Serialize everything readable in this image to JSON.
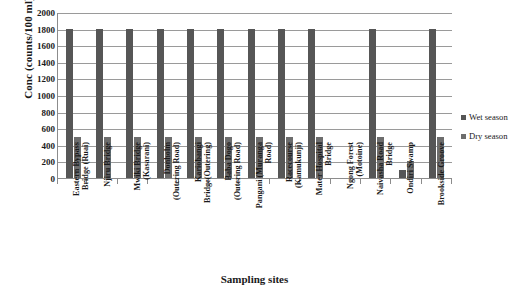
{
  "chart_data": {
    "type": "bar",
    "title": "",
    "xlabel": "Sampling sites",
    "ylabel": "Conc (counts/100 ml)",
    "ylim": [
      0,
      2000
    ],
    "ytick_step": 200,
    "yticks": [
      2000,
      1800,
      1600,
      1400,
      1200,
      1000,
      800,
      600,
      400,
      200,
      0
    ],
    "grid": true,
    "legend_position": "right",
    "categories": [
      "Eastern Bypass Bridge (Ruai)",
      "Njiru Bridge",
      "Mwiki Bridge (Kasarani)",
      "Donholm (Outering Road)",
      "Kariobangi Bridge(Outering)",
      "Baba Dogo (Outering Road)",
      "Pangani (Muranga Road)",
      "Racecourse (Kamukunji)",
      "Mater Hospital Bridge",
      "Ngong Forest (Motoine)",
      "Naivasha Road Bridge",
      "Ondiri Swamp",
      "Brookside Groove"
    ],
    "category_lines": [
      [
        "Eastern Bypass",
        "Bridge (Ruai)"
      ],
      [
        "Njiru Bridge"
      ],
      [
        "Mwiki Bridge",
        "(Kasarani)"
      ],
      [
        "Donholm",
        "(Outering Road)"
      ],
      [
        "Kariobangi",
        "Bridge(Outering)"
      ],
      [
        "Baba Dogo",
        "(Outering Road)"
      ],
      [
        "Pangani (Muranga",
        "Road)"
      ],
      [
        "Racecourse",
        "(Kamukunji)"
      ],
      [
        "Mater Hospital",
        "Bridge"
      ],
      [
        "Ngong Forest",
        "(Motoine)"
      ],
      [
        "Naivasha Road",
        "Bridge"
      ],
      [
        "Ondiri Swamp"
      ],
      [
        "Brookside Groove"
      ]
    ],
    "series": [
      {
        "name": "Wet season",
        "color": "#565656",
        "values": [
          1800,
          1800,
          1800,
          1800,
          1800,
          1800,
          1800,
          1800,
          1800,
          0,
          1800,
          100,
          1800
        ]
      },
      {
        "name": "Dry season",
        "color": "#6d6d6d",
        "values": [
          500,
          500,
          500,
          500,
          500,
          500,
          500,
          500,
          500,
          0,
          500,
          200,
          500
        ]
      }
    ]
  }
}
